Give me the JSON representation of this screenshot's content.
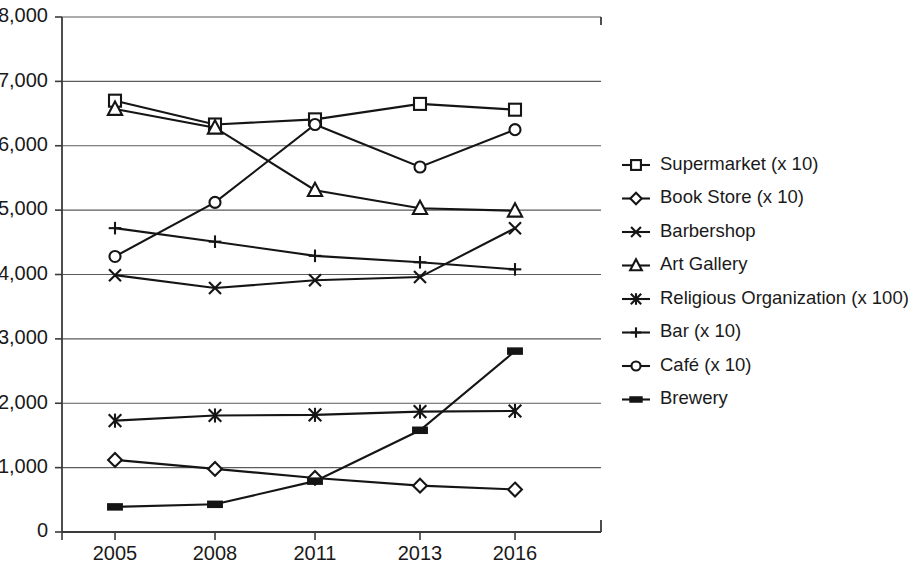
{
  "chart_data": {
    "type": "line",
    "title": "",
    "xlabel": "",
    "ylabel": "",
    "categories": [
      "2005",
      "2008",
      "2011",
      "2013",
      "2016"
    ],
    "x": [
      2005,
      2008,
      2011,
      2013,
      2016
    ],
    "ylim": [
      0,
      8000
    ],
    "ytick_labels": [
      "8,000",
      "7,000",
      "6,000",
      "5,000",
      "4,000",
      "3,000",
      "2,000",
      "1,000",
      "0"
    ],
    "ytick_values": [
      8000,
      7000,
      6000,
      5000,
      4000,
      3000,
      2000,
      1000,
      0
    ],
    "grid": "horizontal",
    "legend_position": "right",
    "series": [
      {
        "name": "Supermarket (x 10)",
        "marker": "square-open",
        "values": [
          6700,
          6330,
          6410,
          6650,
          6560
        ]
      },
      {
        "name": "Book Store (x 10)",
        "marker": "diamond-open",
        "values": [
          1120,
          980,
          840,
          720,
          660
        ]
      },
      {
        "name": "Barbershop",
        "marker": "x-cross",
        "values": [
          3990,
          3790,
          3910,
          3960,
          4720
        ]
      },
      {
        "name": "Art Gallery",
        "marker": "triangle-open",
        "values": [
          6570,
          6280,
          5310,
          5030,
          4990
        ]
      },
      {
        "name": "Religious Organization (x 100)",
        "marker": "star-asterisk",
        "values": [
          1730,
          1810,
          1820,
          1870,
          1880
        ]
      },
      {
        "name": "Bar (x 10)",
        "marker": "plus-cross",
        "values": [
          4720,
          4510,
          4290,
          4190,
          4080
        ]
      },
      {
        "name": "Café (x 10)",
        "marker": "circle-open",
        "values": [
          4280,
          5120,
          6330,
          5670,
          6250
        ]
      },
      {
        "name": "Brewery",
        "marker": "bar-solid",
        "values": [
          390,
          430,
          790,
          1580,
          2810
        ]
      }
    ]
  },
  "legend": {
    "items": [
      "Supermarket (x 10)",
      "Book Store (x 10)",
      "Barbershop",
      "Art Gallery",
      "Religious Organization (x 100)",
      "Bar (x 10)",
      "Café (x 10)",
      "Brewery"
    ]
  }
}
